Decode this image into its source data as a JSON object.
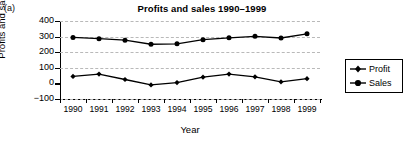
{
  "figure_label": "(a)",
  "chart_data": {
    "type": "line",
    "title": "Profits and sales 1990–1999",
    "xlabel": "Year",
    "ylabel": "Profits and sales",
    "categories": [
      "1990",
      "1991",
      "1992",
      "1993",
      "1994",
      "1995",
      "1996",
      "1997",
      "1998",
      "1999"
    ],
    "yticks": [
      "400",
      "300",
      "200",
      "100",
      "0",
      "−100"
    ],
    "ylim": [
      -100,
      400
    ],
    "grid": true,
    "legend_position": "right",
    "series": [
      {
        "name": "Profit",
        "marker": "diamond",
        "color": "#000000",
        "values": [
          45,
          60,
          25,
          -10,
          5,
          40,
          60,
          42,
          10,
          30
        ]
      },
      {
        "name": "Sales",
        "marker": "circle",
        "color": "#000000",
        "values": [
          295,
          287,
          277,
          251,
          254,
          280,
          292,
          302,
          291,
          318
        ]
      }
    ]
  },
  "legend": {
    "items": [
      {
        "label": "Profit"
      },
      {
        "label": "Sales"
      }
    ]
  }
}
